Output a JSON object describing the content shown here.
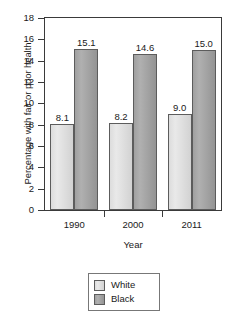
{
  "chart_data": {
    "type": "bar",
    "title": "",
    "subtitle": "",
    "xlabel": "Year",
    "ylabel": "Percentage with fair or poor health",
    "categories": [
      "1990",
      "2000",
      "2011"
    ],
    "series": [
      {
        "name": "White",
        "values": [
          8.1,
          8.2,
          9.0
        ],
        "color": "#dcdcdc"
      },
      {
        "name": "Black",
        "values": [
          15.1,
          14.6,
          15.0
        ],
        "color": "#a0a0a0"
      }
    ],
    "value_labels": [
      [
        "8.1",
        "8.2",
        "9.0"
      ],
      [
        "15.1",
        "14.6",
        "15.0"
      ]
    ],
    "ylim": [
      0,
      18
    ],
    "ytick_step": 2,
    "yticks": [
      0,
      2,
      4,
      6,
      8,
      10,
      12,
      14,
      16,
      18
    ],
    "ytick_labels": [
      "0",
      "2",
      "4",
      "6",
      "8",
      "10",
      "12",
      "14",
      "16",
      "18"
    ],
    "grid": false,
    "legend_position": "bottom-center",
    "legend_entries": [
      "White",
      "Black"
    ]
  }
}
